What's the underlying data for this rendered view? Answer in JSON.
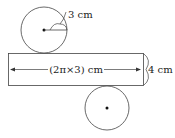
{
  "diagram": {
    "radius_label": "3 cm",
    "width_label": "(2π×3) cm",
    "height_label": "4 cm",
    "colors": {
      "stroke": "#333333",
      "text": "#222222",
      "background": "#ffffff"
    }
  }
}
